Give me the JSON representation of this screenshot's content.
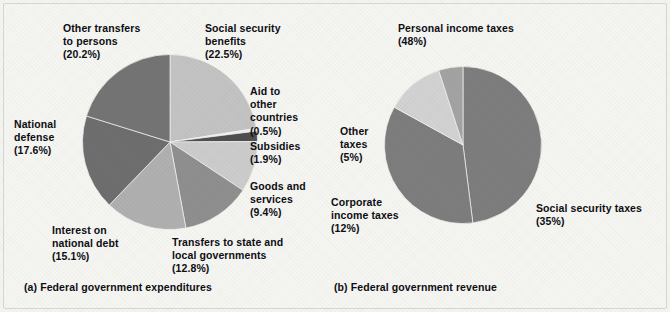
{
  "figure": {
    "background_color": "#f4f4f1",
    "frame_color": "#d7d7d2",
    "text_color": "#0e0e12"
  },
  "panel_a": {
    "caption": "(a) Federal government expenditures",
    "labels": {
      "other_transfers": "Other transfers\nto persons\n(20.2%)",
      "social_security": "Social security\nbenefits\n(22.5%)",
      "aid": "Aid to\nother\ncountries\n(0.5%)",
      "subsidies": "Subsidies\n(1.9%)",
      "goods": "Goods and\nservices\n(9.4%)",
      "transfers_state": "Transfers to state and\nlocal governments\n(12.8%)",
      "interest": "Interest on\nnational debt\n(15.1%)",
      "national_defense": "National\ndefense\n(17.6%)"
    }
  },
  "panel_b": {
    "caption": "(b) Federal government revenue",
    "labels": {
      "personal": "Personal income taxes\n(48%)",
      "other_taxes": "Other\ntaxes\n(5%)",
      "corporate": "Corporate\nincome taxes\n(12%)",
      "social_security_taxes": "Social security taxes\n(35%)"
    }
  },
  "chart_data": [
    {
      "type": "pie",
      "id": "federal-government-expenditures",
      "title": "(a) Federal government expenditures",
      "unit": "percent",
      "start_angle_deg": 0,
      "direction": "clockwise",
      "center": [
        170,
        142
      ],
      "radius": 88,
      "categories": [
        "Social security benefits",
        "Aid to other countries",
        "Subsidies",
        "Goods and services",
        "Transfers to state and local governments",
        "Interest on national debt",
        "National defense",
        "Other transfers to persons"
      ],
      "values": [
        22.5,
        0.5,
        1.9,
        9.4,
        12.8,
        15.1,
        17.6,
        20.2
      ],
      "value_labels": [
        "(22.5%)",
        "(0.5%)",
        "(1.9%)",
        "(9.4%)",
        "(12.8%)",
        "(15.1%)",
        "(17.6%)",
        "(20.2%)"
      ],
      "colors": [
        "#c3c3c3",
        "#eeeeec",
        "#4f4f4f",
        "#cccccc",
        "#8f8f8f",
        "#b0b0b0",
        "#6e6e6e",
        "#747474"
      ],
      "legend": "labels-outside"
    },
    {
      "type": "pie",
      "id": "federal-government-revenue",
      "title": "(b) Federal government revenue",
      "unit": "percent",
      "start_angle_deg": 0,
      "direction": "clockwise",
      "center": [
        463,
        145
      ],
      "radius": 79,
      "categories": [
        "Personal income taxes",
        "Social security taxes",
        "Corporate income taxes",
        "Other taxes"
      ],
      "values": [
        48,
        35,
        12,
        5
      ],
      "value_labels": [
        "(48%)",
        "(35%)",
        "(12%)",
        "(5%)"
      ],
      "colors": [
        "#7d7d7d",
        "#7d7d7d",
        "#d2d2d2",
        "#a3a3a3"
      ],
      "legend": "labels-outside"
    }
  ]
}
